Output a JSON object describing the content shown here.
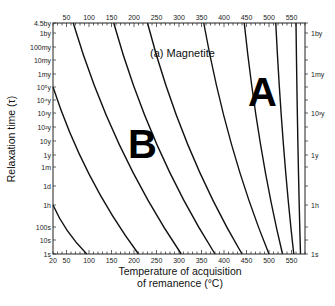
{
  "chart_data": {
    "type": "line",
    "title": "(a) Magnetite",
    "xlabel": "Temperature of acquisition of remanence (°C)",
    "xlabel_lines": [
      "Temperature of acquisition",
      "of remanence (°C)"
    ],
    "ylabel": "Relaxation time (τ)",
    "xlim": [
      20,
      580
    ],
    "x_ticks_bottom": [
      20,
      50,
      100,
      150,
      200,
      250,
      300,
      350,
      400,
      450,
      500,
      550
    ],
    "x_ticks_top": [
      50,
      100,
      150,
      200,
      250,
      300,
      350,
      400,
      450,
      500,
      550
    ],
    "y_ticks_left": [
      "4.5by",
      "1by",
      "100my",
      "10my",
      "1my",
      "10⁵y",
      "10⁴y",
      "10³y",
      "10²y",
      "10y",
      "1y",
      "1m",
      "1d",
      "1h",
      "100s",
      "10s",
      "1s"
    ],
    "y_ticks_right": [
      "1by",
      "1my",
      "10³y",
      "1y",
      "1h",
      "1s"
    ],
    "annotations": [
      {
        "text": "A",
        "region": "upper right"
      },
      {
        "text": "B",
        "region": "middle left"
      },
      {
        "text": "(a) Magnetite",
        "region": "top center"
      }
    ],
    "series": [
      {
        "name": "contour 1",
        "points": [
          [
            20,
            "1h"
          ],
          [
            95,
            "1s"
          ]
        ]
      },
      {
        "name": "contour 2",
        "points": [
          [
            20,
            "10⁵y"
          ],
          [
            210,
            "1s"
          ]
        ]
      },
      {
        "name": "contour 3",
        "points": [
          [
            65,
            "4.5by"
          ],
          [
            305,
            "1s"
          ]
        ]
      },
      {
        "name": "contour 4",
        "points": [
          [
            155,
            "4.5by"
          ],
          [
            380,
            "1s"
          ]
        ]
      },
      {
        "name": "contour 5",
        "points": [
          [
            230,
            "4.5by"
          ],
          [
            440,
            "1s"
          ]
        ]
      },
      {
        "name": "contour 6",
        "points": [
          [
            355,
            "4.5by"
          ],
          [
            500,
            "1s"
          ]
        ]
      },
      {
        "name": "contour 7",
        "points": [
          [
            445,
            "4.5by"
          ],
          [
            530,
            "1s"
          ]
        ]
      },
      {
        "name": "contour 8",
        "points": [
          [
            515,
            "4.5by"
          ],
          [
            555,
            "1s"
          ]
        ]
      },
      {
        "name": "contour 9",
        "points": [
          [
            560,
            "4.5by"
          ],
          [
            570,
            "1s"
          ]
        ]
      }
    ],
    "grid": false,
    "legend": "none"
  },
  "labels": {
    "region_a": "A",
    "region_b": "B",
    "panel": "(a) Magnetite",
    "ylabel": "Relaxation time (τ)",
    "xlabel_1": "Temperature of acquisition",
    "xlabel_2": "of remanence (°C)"
  }
}
